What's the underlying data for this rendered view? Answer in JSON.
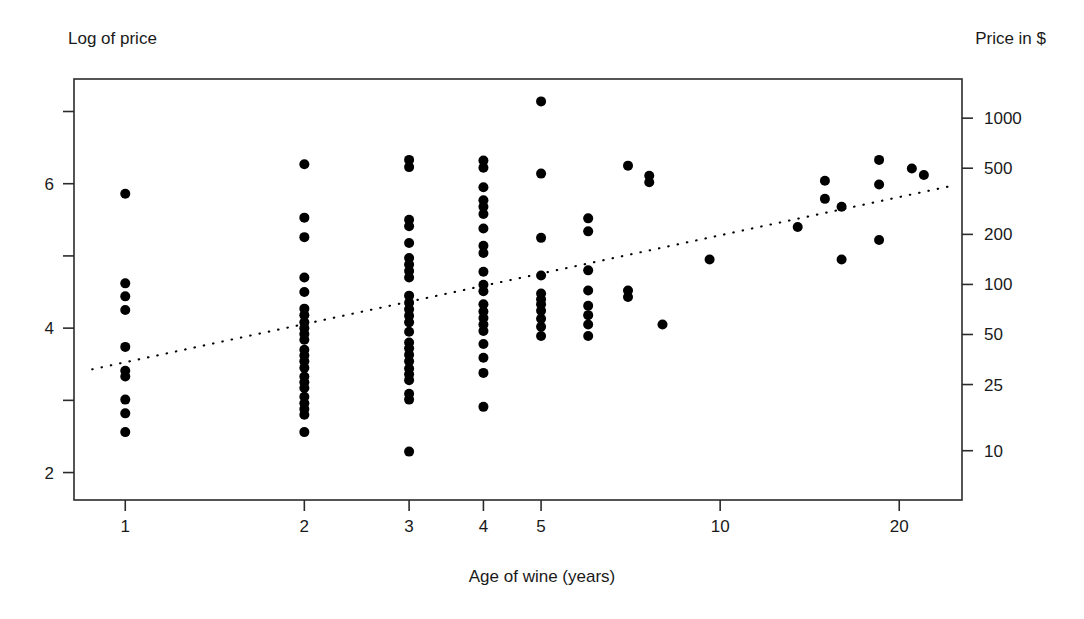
{
  "chart_data": {
    "type": "scatter",
    "title": "",
    "xlabel": "Age of wine (years)",
    "ylabel": "Log of price",
    "y2label": "Price in $",
    "xscale": "log",
    "yscale": "linear",
    "xlim": [
      0.82,
      25.5
    ],
    "ylim": [
      1.62,
      7.45
    ],
    "grid": false,
    "legend": null,
    "xticks": [
      1,
      2,
      3,
      4,
      5,
      10,
      20
    ],
    "xticklabels": [
      "1",
      "2",
      "3",
      "4",
      "5",
      "10",
      "20"
    ],
    "yticks": [
      2,
      3,
      4,
      5,
      6,
      7
    ],
    "yticklabels": [
      "2",
      "",
      "4",
      "",
      "6",
      ""
    ],
    "y2ticks": [
      10,
      25,
      50,
      100,
      200,
      500,
      1000
    ],
    "y2ticklabels": [
      "10",
      "25",
      "50",
      "100",
      "200",
      "500",
      "1000"
    ],
    "marker": "filled-circle",
    "marker_color": "#000000",
    "points": [
      {
        "x": 1,
        "y": 5.86
      },
      {
        "x": 1,
        "y": 4.62
      },
      {
        "x": 1,
        "y": 4.44
      },
      {
        "x": 1,
        "y": 4.25
      },
      {
        "x": 1,
        "y": 3.74
      },
      {
        "x": 1,
        "y": 3.41
      },
      {
        "x": 1,
        "y": 3.33
      },
      {
        "x": 1,
        "y": 3.01
      },
      {
        "x": 1,
        "y": 2.82
      },
      {
        "x": 1,
        "y": 2.56
      },
      {
        "x": 2,
        "y": 6.27
      },
      {
        "x": 2,
        "y": 5.53
      },
      {
        "x": 2,
        "y": 5.26
      },
      {
        "x": 2,
        "y": 4.7
      },
      {
        "x": 2,
        "y": 4.5
      },
      {
        "x": 2,
        "y": 4.27
      },
      {
        "x": 2,
        "y": 4.18
      },
      {
        "x": 2,
        "y": 4.08
      },
      {
        "x": 2,
        "y": 4.0
      },
      {
        "x": 2,
        "y": 3.92
      },
      {
        "x": 2,
        "y": 3.84
      },
      {
        "x": 2,
        "y": 3.7
      },
      {
        "x": 2,
        "y": 3.62
      },
      {
        "x": 2,
        "y": 3.54
      },
      {
        "x": 2,
        "y": 3.45
      },
      {
        "x": 2,
        "y": 3.33
      },
      {
        "x": 2,
        "y": 3.25
      },
      {
        "x": 2,
        "y": 3.17
      },
      {
        "x": 2,
        "y": 3.05
      },
      {
        "x": 2,
        "y": 2.96
      },
      {
        "x": 2,
        "y": 2.88
      },
      {
        "x": 2,
        "y": 2.8
      },
      {
        "x": 2,
        "y": 2.56
      },
      {
        "x": 3,
        "y": 6.33
      },
      {
        "x": 3,
        "y": 6.23
      },
      {
        "x": 3,
        "y": 5.5
      },
      {
        "x": 3,
        "y": 5.41
      },
      {
        "x": 3,
        "y": 5.18
      },
      {
        "x": 3,
        "y": 4.97
      },
      {
        "x": 3,
        "y": 4.88
      },
      {
        "x": 3,
        "y": 4.79
      },
      {
        "x": 3,
        "y": 4.7
      },
      {
        "x": 3,
        "y": 4.45
      },
      {
        "x": 3,
        "y": 4.35
      },
      {
        "x": 3,
        "y": 4.26
      },
      {
        "x": 3,
        "y": 4.17
      },
      {
        "x": 3,
        "y": 4.08
      },
      {
        "x": 3,
        "y": 3.95
      },
      {
        "x": 3,
        "y": 3.8
      },
      {
        "x": 3,
        "y": 3.72
      },
      {
        "x": 3,
        "y": 3.63
      },
      {
        "x": 3,
        "y": 3.54
      },
      {
        "x": 3,
        "y": 3.44
      },
      {
        "x": 3,
        "y": 3.36
      },
      {
        "x": 3,
        "y": 3.28
      },
      {
        "x": 3,
        "y": 3.09
      },
      {
        "x": 3,
        "y": 3.01
      },
      {
        "x": 3,
        "y": 2.29
      },
      {
        "x": 4,
        "y": 6.32
      },
      {
        "x": 4,
        "y": 6.22
      },
      {
        "x": 4,
        "y": 5.95
      },
      {
        "x": 4,
        "y": 5.77
      },
      {
        "x": 4,
        "y": 5.68
      },
      {
        "x": 4,
        "y": 5.58
      },
      {
        "x": 4,
        "y": 5.38
      },
      {
        "x": 4,
        "y": 5.14
      },
      {
        "x": 4,
        "y": 5.04
      },
      {
        "x": 4,
        "y": 4.78
      },
      {
        "x": 4,
        "y": 4.6
      },
      {
        "x": 4,
        "y": 4.51
      },
      {
        "x": 4,
        "y": 4.33
      },
      {
        "x": 4,
        "y": 4.23
      },
      {
        "x": 4,
        "y": 4.14
      },
      {
        "x": 4,
        "y": 4.05
      },
      {
        "x": 4,
        "y": 3.96
      },
      {
        "x": 4,
        "y": 3.78
      },
      {
        "x": 4,
        "y": 3.59
      },
      {
        "x": 4,
        "y": 3.38
      },
      {
        "x": 4,
        "y": 2.91
      },
      {
        "x": 5,
        "y": 7.14
      },
      {
        "x": 5,
        "y": 6.14
      },
      {
        "x": 5,
        "y": 5.25
      },
      {
        "x": 5,
        "y": 4.73
      },
      {
        "x": 5,
        "y": 4.48
      },
      {
        "x": 5,
        "y": 4.4
      },
      {
        "x": 5,
        "y": 4.33
      },
      {
        "x": 5,
        "y": 4.24
      },
      {
        "x": 5,
        "y": 4.13
      },
      {
        "x": 5,
        "y": 4.02
      },
      {
        "x": 5,
        "y": 3.89
      },
      {
        "x": 6,
        "y": 5.52
      },
      {
        "x": 6,
        "y": 5.34
      },
      {
        "x": 6,
        "y": 4.8
      },
      {
        "x": 6,
        "y": 4.52
      },
      {
        "x": 6,
        "y": 4.31
      },
      {
        "x": 6,
        "y": 4.18
      },
      {
        "x": 6,
        "y": 4.05
      },
      {
        "x": 6,
        "y": 3.89
      },
      {
        "x": 7,
        "y": 6.25
      },
      {
        "x": 7,
        "y": 4.52
      },
      {
        "x": 7,
        "y": 4.43
      },
      {
        "x": 7.6,
        "y": 6.11
      },
      {
        "x": 7.6,
        "y": 6.02
      },
      {
        "x": 8,
        "y": 4.05
      },
      {
        "x": 9.6,
        "y": 4.95
      },
      {
        "x": 13.5,
        "y": 5.4
      },
      {
        "x": 15,
        "y": 6.04
      },
      {
        "x": 15,
        "y": 5.79
      },
      {
        "x": 16,
        "y": 5.68
      },
      {
        "x": 16,
        "y": 4.95
      },
      {
        "x": 18.5,
        "y": 6.33
      },
      {
        "x": 18.5,
        "y": 5.99
      },
      {
        "x": 18.5,
        "y": 5.22
      },
      {
        "x": 21,
        "y": 6.21
      },
      {
        "x": 22,
        "y": 6.12
      }
    ],
    "trendline": {
      "style": "dotted",
      "color": "#000000",
      "x_start": 0.88,
      "y_start": 3.43,
      "x_end": 24.5,
      "y_end": 5.97
    }
  },
  "labels": {
    "y_axis_title": "Log of price",
    "y2_axis_title": "Price in $",
    "x_axis_title": "Age of wine (years)"
  }
}
